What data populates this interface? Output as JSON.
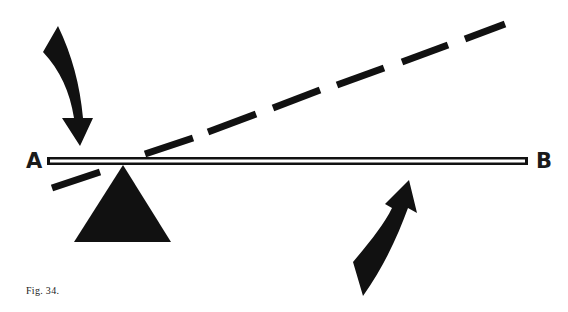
{
  "figure": {
    "caption": "Fig. 34.",
    "labels": {
      "left_end": "A",
      "right_end": "B"
    },
    "elements": [
      {
        "name": "lever-bar",
        "description": "horizontal double-outlined lever from A to B"
      },
      {
        "name": "fulcrum",
        "description": "solid black triangle under lever near A"
      },
      {
        "name": "dashed-line",
        "description": "dashed line rising from lower-left through fulcrum to upper-right"
      },
      {
        "name": "down-arrow",
        "description": "curved black arrow pointing down at end A"
      },
      {
        "name": "up-arrow",
        "description": "curved black arrow pointing up under lever near B"
      }
    ],
    "colors": {
      "ink": "#111111",
      "background": "#ffffff"
    }
  }
}
